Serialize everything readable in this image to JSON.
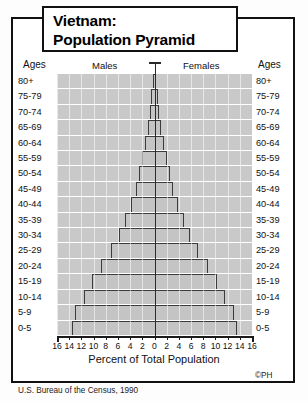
{
  "title": {
    "line1": "Vietnam:",
    "line2": "Population Pyramid"
  },
  "captions": {
    "ages_left": "Ages",
    "males": "Males",
    "females": "Females",
    "ages_right": "Ages"
  },
  "axis": {
    "title": "Percent of Total Population",
    "tick_labels": [
      "16",
      "14",
      "12",
      "10",
      "8",
      "6",
      "4",
      "2",
      "0",
      "2",
      "4",
      "6",
      "8",
      "10",
      "12",
      "14",
      "16"
    ]
  },
  "footer": {
    "source": "U.S. Bureau of the Census, 1990",
    "credit": "©PH"
  },
  "colors": {
    "plot_background": "#c9c9c9",
    "bar_fill": "#c4c4c4",
    "bar_stroke": "#3b3b3b",
    "axis": "#1a1a1a",
    "text": "#111111",
    "page": "#ffffff"
  },
  "chart_data": {
    "type": "bar",
    "subtype": "population-pyramid",
    "title": "Vietnam: Population Pyramid",
    "xlabel": "Percent of Total Population",
    "ylabel": "Ages",
    "xlim": [
      -16,
      16
    ],
    "xticks": [
      -16,
      -14,
      -12,
      -10,
      -8,
      -6,
      -4,
      -2,
      0,
      2,
      4,
      6,
      8,
      10,
      12,
      14,
      16
    ],
    "xtick_labels": [
      "16",
      "14",
      "12",
      "10",
      "8",
      "6",
      "4",
      "2",
      "0",
      "2",
      "4",
      "6",
      "8",
      "10",
      "12",
      "14",
      "16"
    ],
    "grid": true,
    "legend": [
      "Males",
      "Females"
    ],
    "legend_position": "top",
    "source": "U.S. Bureau of the Census, 1990",
    "categories": [
      "80+",
      "75-79",
      "70-74",
      "65-69",
      "60-64",
      "55-59",
      "50-54",
      "45-49",
      "40-44",
      "35-39",
      "30-34",
      "25-29",
      "20-24",
      "15-19",
      "10-14",
      "5-9",
      "0-5"
    ],
    "series": [
      {
        "name": "Males",
        "side": "left",
        "values": [
          0.3,
          0.5,
          0.7,
          1.1,
          1.5,
          2.0,
          2.5,
          3.1,
          3.9,
          4.8,
          5.9,
          7.2,
          8.7,
          10.2,
          11.5,
          13.0,
          13.5
        ]
      },
      {
        "name": "Females",
        "side": "right",
        "values": [
          0.3,
          0.5,
          0.7,
          1.1,
          1.5,
          2.0,
          2.5,
          3.1,
          3.9,
          4.8,
          5.9,
          7.2,
          8.7,
          10.2,
          11.5,
          13.0,
          13.5
        ]
      }
    ]
  }
}
